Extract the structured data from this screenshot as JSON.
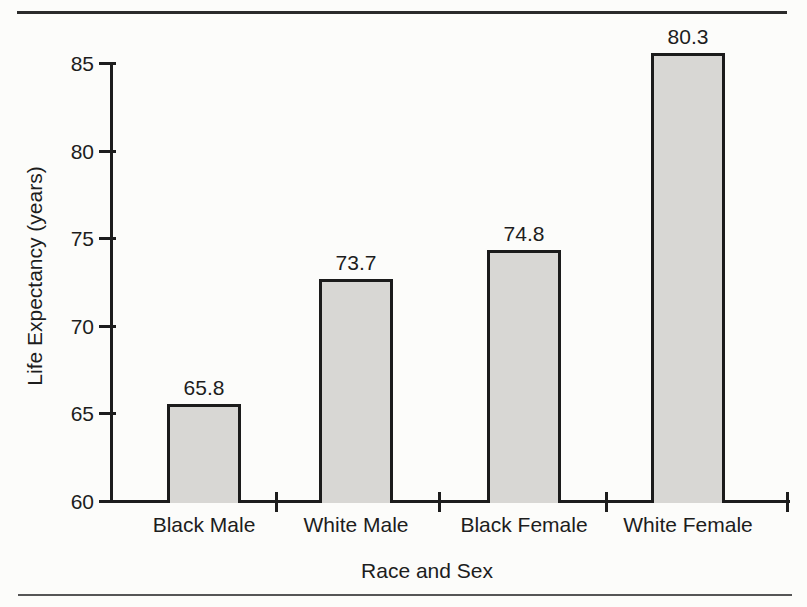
{
  "chart_data": {
    "type": "bar",
    "title": "",
    "categories": [
      "Black Male",
      "White Male",
      "Black Female",
      "White Female"
    ],
    "values": [
      65.8,
      73.7,
      74.8,
      80.3
    ],
    "value_labels": [
      "65.8",
      "73.7",
      "74.8",
      "80.3"
    ],
    "xlabel": "Race and Sex",
    "ylabel": "Life Expectancy (years)",
    "ylim": [
      60,
      85
    ],
    "yticks": [
      60,
      65,
      70,
      75,
      80,
      85
    ],
    "ytick_labels": [
      "60",
      "65",
      "70",
      "75",
      "80",
      "85"
    ],
    "grid": false,
    "legend": "none",
    "bar_fill_color": "#d8d7d4",
    "bar_border_color": "#1b1b1b",
    "drawn_bar_tops_years": [
      65.6,
      72.7,
      74.4,
      85.6
    ]
  },
  "style": {
    "paper_color": "#fcfcfa",
    "ink_color": "#1d1d1d",
    "top_rule_color": "#2b2b2b",
    "bottom_rule_color": "#565656"
  }
}
